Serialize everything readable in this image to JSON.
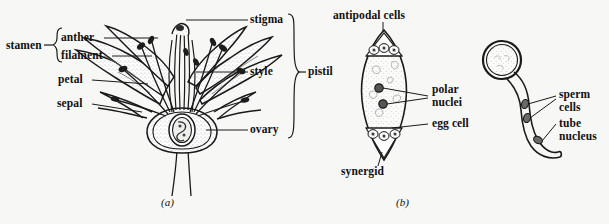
{
  "figure": {
    "background_color": "#f7f7f5",
    "ink_color": "#1a1a1a"
  },
  "panels": [
    {
      "id": "a",
      "caption": "(a)",
      "subject": "flower-longitudinal-section",
      "labels": {
        "stamen": "stamen",
        "anther": "anther",
        "filament": "filament",
        "petal": "petal",
        "sepal": "sepal",
        "stigma": "stigma",
        "style": "style",
        "ovary": "ovary",
        "pistil": "pistil"
      },
      "braces": [
        {
          "name": "stamen-brace",
          "groups": [
            "anther",
            "filament"
          ]
        },
        {
          "name": "pistil-brace",
          "groups": [
            "stigma",
            "style",
            "ovary"
          ]
        }
      ]
    },
    {
      "id": "b",
      "caption": "(b)",
      "subject": "embryo-sac-and-pollen-tube",
      "labels": {
        "antipodal_cells": "antipodal cells",
        "polar_nuclei_line1": "polar",
        "polar_nuclei_line2": "nuclei",
        "egg_cell": "egg cell",
        "synergid": "synergid",
        "sperm_cells_line1": "sperm",
        "sperm_cells_line2": "cells",
        "tube_nucleus_line1": "tube",
        "tube_nucleus_line2": "nucleus"
      }
    }
  ]
}
